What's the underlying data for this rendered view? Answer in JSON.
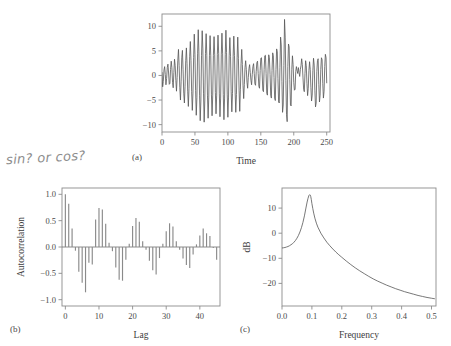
{
  "figure": {
    "title_remnant": "",
    "annotation": "sin? or cos?",
    "panel_tags": {
      "a": "(a)",
      "b": "(b)",
      "c": "(c)"
    }
  },
  "chart_data": [
    {
      "type": "line",
      "panel": "(a)",
      "title": "",
      "xlabel": "Time",
      "ylabel": "",
      "xlim": [
        0,
        255
      ],
      "ylim": [
        -11.5,
        12.5
      ],
      "xticks": [
        0,
        50,
        100,
        150,
        200,
        250
      ],
      "yticks": [
        -10,
        -5,
        0,
        5,
        10
      ],
      "xticklabels": [
        "0",
        "50",
        "100",
        "150",
        "200",
        "250"
      ],
      "yticklabels": [
        "-10",
        "-5",
        "0",
        "5",
        "10"
      ],
      "grid": false,
      "legend": null,
      "line_color": "#555555",
      "x": [
        0,
        1,
        2,
        3,
        4,
        5,
        6,
        7,
        8,
        9,
        10,
        11,
        12,
        13,
        14,
        15,
        16,
        17,
        18,
        19,
        20,
        21,
        22,
        23,
        24,
        25,
        26,
        27,
        28,
        29,
        30,
        31,
        32,
        33,
        34,
        35,
        36,
        37,
        38,
        39,
        40,
        41,
        42,
        43,
        44,
        45,
        46,
        47,
        48,
        49,
        50,
        51,
        52,
        53,
        54,
        55,
        56,
        57,
        58,
        59,
        60,
        61,
        62,
        63,
        64,
        65,
        66,
        67,
        68,
        69,
        70,
        71,
        72,
        73,
        74,
        75,
        76,
        77,
        78,
        79,
        80,
        81,
        82,
        83,
        84,
        85,
        86,
        87,
        88,
        89,
        90,
        91,
        92,
        93,
        94,
        95,
        96,
        97,
        98,
        99,
        100,
        101,
        102,
        103,
        104,
        105,
        106,
        107,
        108,
        109,
        110,
        111,
        112,
        113,
        114,
        115,
        116,
        117,
        118,
        119,
        120,
        121,
        122,
        123,
        124,
        125,
        126,
        127,
        128,
        129,
        130,
        131,
        132,
        133,
        134,
        135,
        136,
        137,
        138,
        139,
        140,
        141,
        142,
        143,
        144,
        145,
        146,
        147,
        148,
        149,
        150,
        151,
        152,
        153,
        154,
        155,
        156,
        157,
        158,
        159,
        160,
        161,
        162,
        163,
        164,
        165,
        166,
        167,
        168,
        169,
        170,
        171,
        172,
        173,
        174,
        175,
        176,
        177,
        178,
        179,
        180,
        181,
        182,
        183,
        184,
        185,
        186,
        187,
        188,
        189,
        190,
        191,
        192,
        193,
        194,
        195,
        196,
        197,
        198,
        199,
        200,
        201,
        202,
        203,
        204,
        205,
        206,
        207,
        208,
        209,
        210,
        211,
        212,
        213,
        214,
        215,
        216,
        217,
        218,
        219,
        220,
        221,
        222,
        223,
        224,
        225,
        226,
        227,
        228,
        229,
        230,
        231,
        232,
        233,
        234,
        235,
        236,
        237,
        238,
        239,
        240,
        241,
        242,
        243,
        244,
        245,
        246,
        247,
        248,
        249,
        250
      ],
      "y": [
        0.6,
        -2.3,
        -1.2,
        1.1,
        1.8,
        0.2,
        -1.9,
        -0.6,
        1.6,
        2.3,
        0.5,
        -1.8,
        -1.6,
        1.2,
        2.9,
        1.6,
        -1.4,
        -2.5,
        0.6,
        3.3,
        2.0,
        -1.0,
        -3.2,
        -0.4,
        3.1,
        5.3,
        2.0,
        -2.4,
        -5.0,
        -1.3,
        3.6,
        5.1,
        1.2,
        -3.6,
        -5.6,
        -2.2,
        3.0,
        5.6,
        2.4,
        -3.2,
        -6.3,
        -2.6,
        3.8,
        6.9,
        3.0,
        -3.3,
        -7.1,
        -3.6,
        3.6,
        8.4,
        4.3,
        -3.1,
        -8.1,
        -4.5,
        4.4,
        9.3,
        4.8,
        -4.0,
        -9.2,
        -5.2,
        4.1,
        9.1,
        5.4,
        -3.6,
        -9.5,
        -5.0,
        4.5,
        8.5,
        4.1,
        -4.0,
        -8.7,
        -4.4,
        4.0,
        8.1,
        4.0,
        -3.8,
        -8.2,
        -4.0,
        4.1,
        7.9,
        4.2,
        -3.5,
        -7.8,
        -4.0,
        4.3,
        8.2,
        4.5,
        -3.6,
        -8.4,
        -4.6,
        4.2,
        8.6,
        4.4,
        -3.9,
        -9.0,
        -4.6,
        4.3,
        9.2,
        4.7,
        -3.8,
        -8.5,
        -4.4,
        4.0,
        7.7,
        3.9,
        -3.3,
        -7.4,
        -3.7,
        3.9,
        8.0,
        4.1,
        -3.4,
        -7.5,
        -3.9,
        3.6,
        7.8,
        3.4,
        -3.0,
        -7.3,
        -2.8,
        2.4,
        5.3,
        2.2,
        -2.1,
        -4.7,
        -1.8,
        1.6,
        3.0,
        1.2,
        -1.4,
        -2.6,
        -0.4,
        1.4,
        2.2,
        0.6,
        -1.0,
        -1.9,
        0.2,
        1.8,
        2.4,
        0.4,
        -1.7,
        -2.0,
        0.8,
        2.6,
        2.9,
        0.4,
        -2.2,
        -2.6,
        1.0,
        3.5,
        3.6,
        0.5,
        -3.0,
        -3.3,
        1.2,
        4.0,
        4.1,
        0.4,
        -3.6,
        -4.0,
        1.3,
        4.2,
        3.6,
        0.2,
        -4.0,
        -4.6,
        1.0,
        4.6,
        4.0,
        -0.4,
        -4.6,
        -5.1,
        1.2,
        5.4,
        4.8,
        -0.6,
        -5.4,
        -5.6,
        1.6,
        7.8,
        6.2,
        -1.2,
        -7.5,
        -6.0,
        2.0,
        11.4,
        7.8,
        -1.0,
        -8.0,
        -9.4,
        1.8,
        6.4,
        5.8,
        -0.8,
        -6.0,
        -6.2,
        1.2,
        4.0,
        2.2,
        -1.4,
        -3.0,
        -2.8,
        0.8,
        1.8,
        1.0,
        0.4,
        1.6,
        0.6,
        -0.2,
        1.2,
        2.0,
        3.4,
        2.2,
        -0.5,
        -2.8,
        -3.3,
        0.4,
        3.0,
        2.0,
        -1.6,
        -4.1,
        -2.6,
        1.0,
        2.8,
        1.2,
        -2.4,
        -5.2,
        -4.0,
        1.0,
        3.5,
        2.1,
        -3.0,
        -6.4,
        -5.6,
        0.8,
        3.0,
        3.4,
        -1.8,
        -5.4,
        -4.0,
        1.2,
        3.6,
        3.2,
        -1.6,
        -4.6,
        -3.2,
        1.8,
        4.3,
        3.6,
        -1.5,
        -4.0,
        -2.6,
        2.0,
        4.8,
        3.2,
        -1.4,
        -3.6,
        -2.0,
        2.2,
        4.2,
        2.6,
        -1.2,
        -2.8,
        -1.0,
        1.8,
        2.6,
        1.2
      ]
    },
    {
      "type": "bar",
      "panel": "(b)",
      "title": "",
      "xlabel": "Lag",
      "ylabel": "Autocorrelation",
      "xlim": [
        -1,
        46
      ],
      "ylim": [
        -1.12,
        1.12
      ],
      "xticks": [
        0,
        10,
        20,
        30,
        40
      ],
      "yticks": [
        -1.0,
        -0.5,
        0.0,
        0.5,
        1.0
      ],
      "xticklabels": [
        "0",
        "10",
        "20",
        "30",
        "40"
      ],
      "yticklabels": [
        "-1.0",
        "-0.5",
        "0.0",
        "0.5",
        "1.0"
      ],
      "grid": false,
      "legend": null,
      "bar_color": "#8a8a8a",
      "categories": [
        0,
        1,
        2,
        3,
        4,
        5,
        6,
        7,
        8,
        9,
        10,
        11,
        12,
        13,
        14,
        15,
        16,
        17,
        18,
        19,
        20,
        21,
        22,
        23,
        24,
        25,
        26,
        27,
        28,
        29,
        30,
        31,
        32,
        33,
        34,
        35,
        36,
        37,
        38,
        39,
        40,
        41,
        42,
        43,
        44,
        45
      ],
      "values": [
        1.0,
        0.82,
        0.35,
        -0.07,
        -0.47,
        -0.68,
        -0.86,
        -0.3,
        -0.33,
        0.52,
        0.74,
        0.71,
        0.44,
        0.08,
        -0.08,
        -0.39,
        -0.62,
        -0.64,
        -0.24,
        0.06,
        0.4,
        0.55,
        0.48,
        0.11,
        -0.05,
        -0.26,
        -0.44,
        -0.52,
        -0.21,
        0.06,
        0.3,
        0.45,
        0.39,
        0.11,
        -0.05,
        -0.22,
        -0.34,
        -0.4,
        -0.14,
        0.05,
        0.22,
        0.35,
        0.26,
        0.21,
        -0.02,
        -0.24
      ]
    },
    {
      "type": "line",
      "panel": "(c)",
      "title": "",
      "xlabel": "Frequency",
      "ylabel": "dB",
      "xlim": [
        0.0,
        0.515
      ],
      "ylim": [
        -29,
        18
      ],
      "xticks": [
        0.0,
        0.1,
        0.2,
        0.3,
        0.4,
        0.5
      ],
      "yticks": [
        -20,
        -10,
        0,
        10
      ],
      "xticklabels": [
        "0.0",
        "0.1",
        "0.2",
        "0.3",
        "0.4",
        "0.5"
      ],
      "yticklabels": [
        "-20",
        "-10",
        "0",
        "10"
      ],
      "grid": false,
      "legend": null,
      "line_color": "#555555",
      "peak_frequency": 0.095,
      "peak_value": 15.3,
      "x": [
        0.0,
        0.005,
        0.01,
        0.015,
        0.02,
        0.025,
        0.03,
        0.035,
        0.04,
        0.045,
        0.05,
        0.055,
        0.06,
        0.065,
        0.07,
        0.075,
        0.08,
        0.084,
        0.087,
        0.09,
        0.092,
        0.094,
        0.095,
        0.096,
        0.098,
        0.1,
        0.103,
        0.106,
        0.11,
        0.115,
        0.12,
        0.13,
        0.14,
        0.15,
        0.16,
        0.17,
        0.18,
        0.19,
        0.2,
        0.215,
        0.23,
        0.245,
        0.26,
        0.275,
        0.29,
        0.305,
        0.32,
        0.335,
        0.35,
        0.365,
        0.38,
        0.395,
        0.41,
        0.425,
        0.44,
        0.455,
        0.47,
        0.485,
        0.5,
        0.51
      ],
      "y": [
        -5.9,
        -5.8,
        -5.7,
        -5.5,
        -5.3,
        -5.0,
        -4.6,
        -4.2,
        -3.6,
        -2.9,
        -2.0,
        -0.9,
        0.5,
        2.2,
        4.3,
        6.9,
        10.0,
        12.4,
        13.9,
        15.0,
        15.3,
        15.2,
        15.1,
        14.7,
        13.4,
        11.8,
        9.8,
        8.0,
        6.0,
        4.0,
        2.4,
        0.0,
        -1.9,
        -3.6,
        -5.0,
        -6.3,
        -7.5,
        -8.6,
        -9.6,
        -11.1,
        -12.5,
        -13.8,
        -15.0,
        -16.1,
        -17.2,
        -18.2,
        -19.1,
        -19.9,
        -20.7,
        -21.4,
        -22.1,
        -22.7,
        -23.3,
        -23.8,
        -24.3,
        -24.8,
        -25.2,
        -25.6,
        -25.9,
        -26.1
      ]
    }
  ]
}
